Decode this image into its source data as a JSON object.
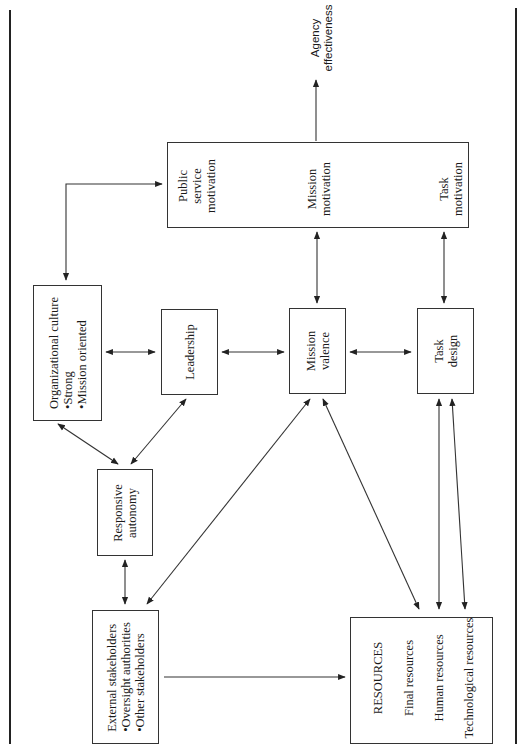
{
  "diagram": {
    "outcome": {
      "line1": "Agency",
      "line2": "effectiveness"
    },
    "motivation_box": {
      "public_service": {
        "line1": "Public",
        "line2": "service",
        "line3": "motivation"
      },
      "mission": {
        "line1": "Mission",
        "line2": "motivation"
      },
      "task": {
        "line1": "Task",
        "line2": "motivation"
      }
    },
    "org_culture": {
      "title": "Organizational culture",
      "items": [
        "•Strong",
        "•Mission oriented"
      ]
    },
    "leadership": {
      "label": "Leadership"
    },
    "mission_valence": {
      "line1": "Mission",
      "line2": "valence"
    },
    "task_design": {
      "line1": "Task",
      "line2": "design"
    },
    "responsive_autonomy": {
      "line1": "Responsive",
      "line2": "autonomy"
    },
    "external_stakeholders": {
      "title": "External stakeholders",
      "items": [
        "•Oversight authorities",
        "•Other stakeholders"
      ]
    },
    "resources": {
      "title": "RESOURCES",
      "items": [
        "Final resources",
        "Human resources",
        "Technological resources"
      ]
    },
    "colors": {
      "line": "#333333",
      "text": "#1a1a1a",
      "background": "#ffffff"
    }
  }
}
